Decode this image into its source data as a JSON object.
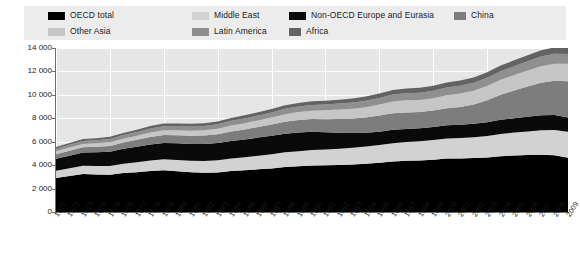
{
  "legend": {
    "items": [
      {
        "label": "OECD total",
        "color": "#000000",
        "row": 1,
        "x": 24
      },
      {
        "label": "Middle East",
        "color": "#d2d2d2",
        "row": 1,
        "x": 168
      },
      {
        "label": "Non-OECD Europe and Eurasia",
        "color": "#0a0a0a",
        "row": 1,
        "x": 265
      },
      {
        "label": "China",
        "color": "#7d7d7d",
        "row": 1,
        "x": 430
      },
      {
        "label": "Other Asia",
        "color": "#c6c6c6",
        "row": 2,
        "x": 24
      },
      {
        "label": "Latin America",
        "color": "#8f8f8f",
        "row": 2,
        "x": 168
      },
      {
        "label": "Africa",
        "color": "#636363",
        "row": 2,
        "x": 265
      }
    ]
  },
  "chart_data": {
    "type": "area",
    "title": "",
    "xlabel": "",
    "ylabel": "",
    "stacked": true,
    "grid": true,
    "legend_position": "top",
    "ylim": [
      0,
      14000
    ],
    "yticks": [
      0,
      2000,
      4000,
      6000,
      8000,
      10000,
      12000,
      14000
    ],
    "ytick_labels": [
      "0",
      "2 000",
      "4 000",
      "6 000",
      "8 000",
      "10 000",
      "12 000",
      "14 000"
    ],
    "categories": [
      "1971",
      "1972",
      "1973",
      "1974",
      "1975",
      "1976",
      "1977",
      "1978",
      "1979",
      "1980",
      "1981",
      "1982",
      "1983",
      "1984",
      "1985",
      "1986",
      "1987",
      "1988",
      "1989",
      "1990",
      "1991",
      "1992",
      "1993",
      "1994",
      "1995",
      "1996",
      "1997",
      "1998",
      "1999",
      "2000",
      "2001",
      "2002",
      "2003",
      "2004",
      "2005",
      "2006",
      "2007",
      "2008",
      "2009"
    ],
    "series": [
      {
        "name": "OECD total",
        "color": "#000000",
        "values": [
          2900,
          3080,
          3250,
          3200,
          3180,
          3320,
          3400,
          3500,
          3560,
          3480,
          3400,
          3360,
          3380,
          3500,
          3560,
          3640,
          3720,
          3840,
          3900,
          3960,
          3990,
          4020,
          4050,
          4120,
          4200,
          4320,
          4380,
          4400,
          4470,
          4560,
          4570,
          4600,
          4660,
          4760,
          4820,
          4860,
          4880,
          4840,
          4640
        ]
      },
      {
        "name": "Middle East",
        "color": "#d2d2d2",
        "values": [
          620,
          660,
          700,
          720,
          740,
          800,
          850,
          900,
          940,
          960,
          980,
          1000,
          1030,
          1070,
          1110,
          1160,
          1200,
          1250,
          1290,
          1330,
          1340,
          1390,
          1430,
          1470,
          1510,
          1550,
          1590,
          1630,
          1670,
          1710,
          1740,
          1780,
          1830,
          1900,
          1960,
          2020,
          2090,
          2160,
          2200
        ]
      },
      {
        "name": "Non-OECD Europe and Eurasia",
        "color": "#0a0a0a",
        "values": [
          1020,
          1070,
          1120,
          1170,
          1220,
          1270,
          1320,
          1370,
          1400,
          1420,
          1430,
          1450,
          1470,
          1500,
          1520,
          1550,
          1580,
          1600,
          1600,
          1560,
          1470,
          1360,
          1270,
          1170,
          1140,
          1150,
          1120,
          1110,
          1120,
          1130,
          1140,
          1150,
          1180,
          1210,
          1230,
          1260,
          1280,
          1290,
          1220
        ]
      },
      {
        "name": "China",
        "color": "#7d7d7d",
        "values": [
          390,
          420,
          450,
          470,
          500,
          540,
          590,
          640,
          670,
          690,
          690,
          710,
          750,
          810,
          860,
          910,
          960,
          1020,
          1060,
          1080,
          1120,
          1170,
          1230,
          1300,
          1380,
          1420,
          1410,
          1400,
          1400,
          1450,
          1520,
          1640,
          1870,
          2130,
          2360,
          2580,
          2790,
          2920,
          3100
        ]
      },
      {
        "name": "Other Asia",
        "color": "#c6c6c6",
        "values": [
          250,
          270,
          290,
          300,
          310,
          330,
          350,
          380,
          400,
          420,
          430,
          450,
          470,
          500,
          530,
          560,
          600,
          640,
          680,
          720,
          760,
          800,
          840,
          890,
          940,
          990,
          1030,
          1020,
          1060,
          1110,
          1140,
          1180,
          1220,
          1280,
          1320,
          1360,
          1410,
          1450,
          1490
        ]
      },
      {
        "name": "Latin America",
        "color": "#8f8f8f",
        "values": [
          230,
          245,
          260,
          275,
          290,
          305,
          325,
          345,
          360,
          370,
          375,
          380,
          385,
          400,
          410,
          425,
          440,
          455,
          470,
          480,
          495,
          515,
          530,
          550,
          570,
          595,
          615,
          630,
          640,
          665,
          670,
          680,
          700,
          730,
          760,
          785,
          815,
          840,
          840
        ]
      },
      {
        "name": "Africa",
        "color": "#636363",
        "values": [
          140,
          150,
          160,
          168,
          176,
          186,
          196,
          208,
          216,
          224,
          230,
          236,
          244,
          254,
          264,
          274,
          286,
          298,
          308,
          318,
          326,
          336,
          346,
          358,
          370,
          382,
          396,
          408,
          420,
          434,
          444,
          456,
          470,
          488,
          504,
          520,
          540,
          558,
          570
        ]
      }
    ]
  }
}
